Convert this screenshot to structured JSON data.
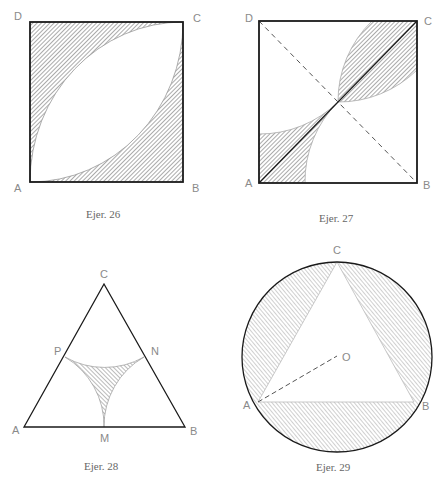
{
  "figures": [
    {
      "id": "fig26",
      "caption": "Ejer. 26",
      "shape": "square with two quarter-circle arcs (centers B and D) forming a lens; corners outside lens shaded",
      "labels": {
        "A": "A",
        "B": "B",
        "C": "C",
        "D": "D"
      }
    },
    {
      "id": "fig27",
      "caption": "Ejer. 27",
      "shape": "square with quarter-circles at B and D meeting at center; shaded regions at corners A and C, solid diagonal AC, dashed diagonal DB",
      "labels": {
        "A": "A",
        "B": "B",
        "C": "C",
        "D": "D"
      }
    },
    {
      "id": "fig28",
      "caption": "Ejer. 28",
      "shape": "equilateral triangle with arcs centered at vertices through midpoints; central curvilinear triangle shaded",
      "labels": {
        "A": "A",
        "B": "B",
        "C": "C",
        "M": "M",
        "N": "N",
        "P": "P"
      }
    },
    {
      "id": "fig29",
      "caption": "Ejer. 29",
      "shape": "equilateral triangle inscribed in circle; three circular segments shaded; dashed radius OA",
      "labels": {
        "A": "A",
        "B": "B",
        "C": "C",
        "O": "O"
      }
    }
  ],
  "colors": {
    "stroke": "#1a1a1a",
    "hatch": "#555555",
    "label": "#8a8a8a",
    "caption": "#666666"
  }
}
